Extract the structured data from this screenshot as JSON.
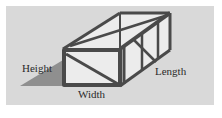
{
  "figure": {
    "type": "box-dimensions-diagram",
    "labels": {
      "height": "Height",
      "width": "Width",
      "length": "Length"
    },
    "colors": {
      "background": "#d9d9d9",
      "frame": "#4a4a4a",
      "face": "#ececec",
      "shadow": "#8f8f8f"
    }
  }
}
